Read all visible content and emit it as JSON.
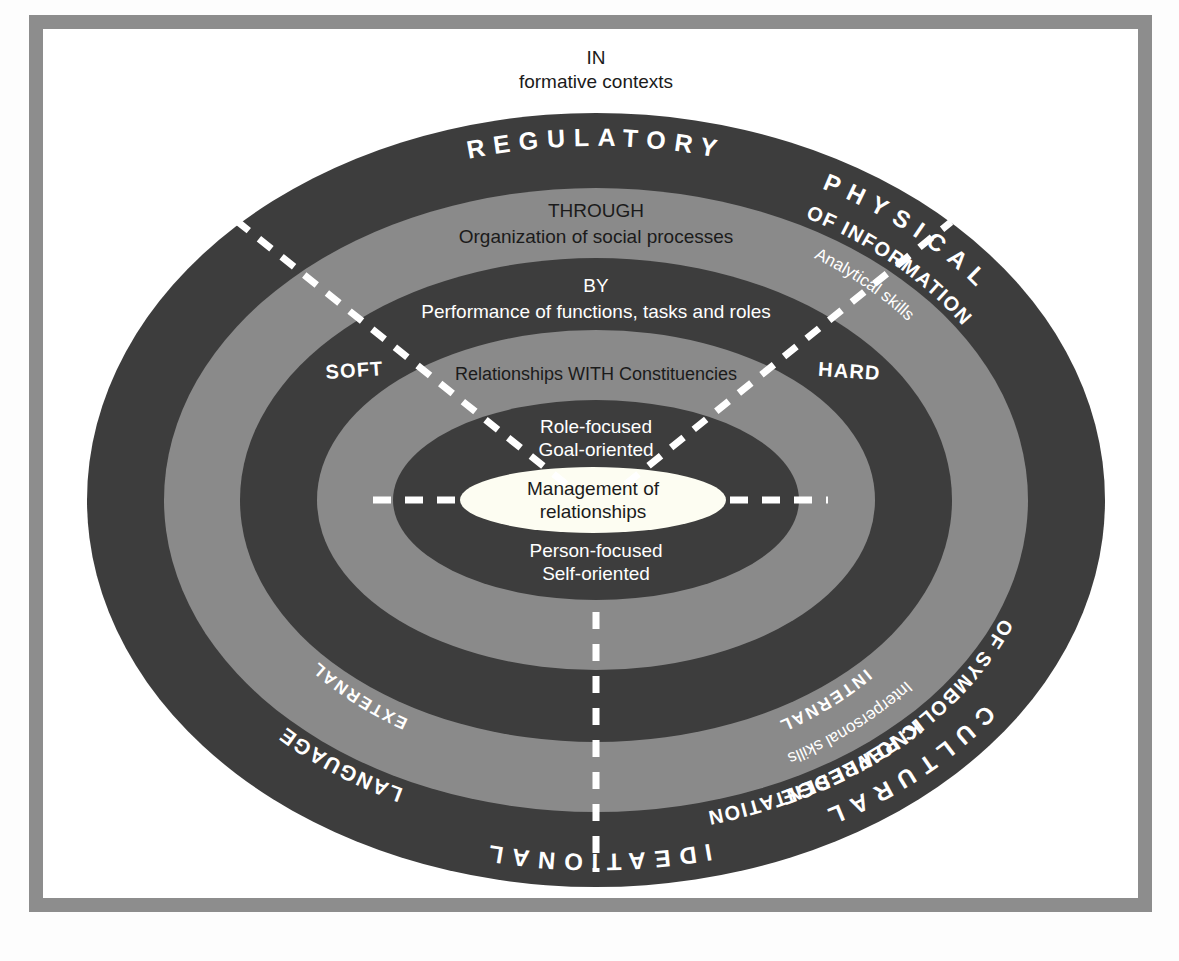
{
  "diagram": {
    "title_top": {
      "line1": "IN",
      "line2": "formative contexts"
    },
    "colors": {
      "dark_ring": "#3d3d3d",
      "light_ring": "#8a8a8a",
      "core": "#fdfdf5",
      "frame": "#8d8d8d",
      "page": "#ffffff",
      "text_light": "#ffffff",
      "text_dark": "#1b1b1b"
    },
    "core": {
      "line1": "Management of",
      "line2": "relationships"
    },
    "rings": [
      {
        "index": 1,
        "name": "outer-context-ring",
        "tone": "dark",
        "top_label": "REGULATORY",
        "bottom_label": "IDEATIONAL",
        "left_label": "CULTURAL",
        "right_label": "PHYSICAL"
      },
      {
        "index": 2,
        "name": "organization-ring",
        "tone": "light",
        "top_label_small": "THROUGH",
        "top_label": "Organization of social processes",
        "left_label": "OF SYMBOLIC REPRESENTATION",
        "right_label": "OF INFORMATION",
        "lower_left_label": "LANGUAGE",
        "lower_right_label": "KNOWLEDGE"
      },
      {
        "index": 3,
        "name": "performance-ring",
        "tone": "dark",
        "top_label_small": "BY",
        "top_label": "Performance of functions, tasks and roles",
        "left_label": "Interpersonal skills",
        "right_label": "Analytical skills",
        "left_quadrant_label": "SOFT",
        "right_quadrant_label": "HARD"
      },
      {
        "index": 4,
        "name": "relationships-ring",
        "tone": "light",
        "top_label": "Relationships WITH Constituencies",
        "left_label": "INTERNAL",
        "right_label": "EXTERNAL"
      },
      {
        "index": 5,
        "name": "focus-ring",
        "tone": "dark",
        "top_label_line1": "Role-focused",
        "top_label_line2": "Goal-oriented",
        "bottom_label_line1": "Person-focused",
        "bottom_label_line2": "Self-oriented"
      }
    ],
    "dividers": [
      {
        "name": "divider-upper-left",
        "style": "dashed",
        "color": "#ffffff"
      },
      {
        "name": "divider-upper-right",
        "style": "dashed",
        "color": "#ffffff"
      },
      {
        "name": "divider-horizontal-left",
        "style": "dashed",
        "color": "#ffffff"
      },
      {
        "name": "divider-horizontal-right",
        "style": "dashed",
        "color": "#ffffff"
      },
      {
        "name": "divider-vertical-bottom",
        "style": "dashed",
        "color": "#ffffff"
      }
    ]
  }
}
